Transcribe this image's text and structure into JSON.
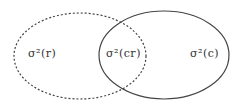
{
  "diagram": {
    "type": "venn",
    "sets": [
      {
        "id": "r",
        "style": "dashed"
      },
      {
        "id": "c",
        "style": "solid"
      }
    ],
    "labels": {
      "left": "σ²(r)",
      "overlap": "σ²(cr)",
      "right": "σ²(c)"
    },
    "stroke_color": "#333333"
  }
}
